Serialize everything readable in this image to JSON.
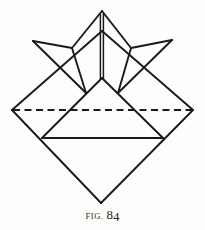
{
  "figure": {
    "caption_prefix": "FIG.",
    "caption_number_major": "8",
    "caption_number_minor": "4",
    "caption_full": "FIG. 84"
  },
  "style": {
    "background_color": "#fdfdfb",
    "ink_color": "#1a1a1a",
    "caption_color": "#2b2b2b",
    "solid_stroke_width": "1.9",
    "dashed_stroke_width": "2.0",
    "dash_pattern": "7,4.5"
  },
  "chart_data": {
    "type": "diagram",
    "units": "pixels",
    "canvas": {
      "width": 205,
      "height": 230
    },
    "points": {
      "star_apex": [
        102,
        11
      ],
      "star_left_tip": [
        33,
        41
      ],
      "star_right_tip": [
        172,
        40
      ],
      "star_left_notch": [
        72,
        48
      ],
      "star_right_notch": [
        131,
        48
      ],
      "diamond_top": [
        102,
        31
      ],
      "diamond_right": [
        193,
        110
      ],
      "diamond_bottom": [
        101,
        203
      ],
      "diamond_left": [
        12,
        110
      ],
      "inner_apex": [
        102,
        78
      ],
      "crease_left": [
        12,
        110
      ],
      "crease_right": [
        193,
        110
      ],
      "base_left": [
        42,
        138
      ],
      "base_right": [
        163,
        138
      ],
      "left_wing_elbow": [
        55,
        58
      ],
      "right_wing_elbow": [
        149,
        58
      ],
      "left_flap_foot": [
        86,
        93
      ],
      "right_flap_foot": [
        118,
        93
      ]
    },
    "segments": [
      {
        "name": "diamond-edge-top-left",
        "style": "solid",
        "from": "diamond_top",
        "to": "diamond_left"
      },
      {
        "name": "diamond-edge-top-right",
        "style": "solid",
        "from": "diamond_top",
        "to": "diamond_right"
      },
      {
        "name": "diamond-edge-bottom-left",
        "style": "solid",
        "from": "diamond_left",
        "to": "diamond_bottom"
      },
      {
        "name": "diamond-edge-bottom-right",
        "style": "solid",
        "from": "diamond_right",
        "to": "diamond_bottom"
      },
      {
        "name": "horizontal-crease",
        "style": "dashed",
        "from": "crease_left",
        "to": "crease_right"
      },
      {
        "name": "base-fold-line",
        "style": "solid",
        "from": "base_left",
        "to": "base_right"
      },
      {
        "name": "center-triangle-left",
        "style": "solid",
        "from": "inner_apex",
        "to": "base_left"
      },
      {
        "name": "center-triangle-right",
        "style": "solid",
        "from": "inner_apex",
        "to": "base_right"
      },
      {
        "name": "center-crease-vertical",
        "style": "double",
        "from": "star_apex",
        "to": "inner_apex"
      },
      {
        "name": "star-left-upper",
        "style": "solid",
        "from": "star_apex",
        "to": "star_left_notch"
      },
      {
        "name": "star-right-upper",
        "style": "solid",
        "from": "star_apex",
        "to": "star_right_notch"
      },
      {
        "name": "star-left-arm-top",
        "style": "solid",
        "from": "star_left_notch",
        "to": "star_left_tip"
      },
      {
        "name": "star-right-arm-top",
        "style": "solid",
        "from": "star_right_notch",
        "to": "star_right_tip"
      },
      {
        "name": "star-left-arm-lower",
        "style": "solid",
        "from": "star_left_tip",
        "to": "left_flap_foot"
      },
      {
        "name": "star-right-arm-lower",
        "style": "solid",
        "from": "star_right_tip",
        "to": "right_flap_foot"
      },
      {
        "name": "left-flap-inner-edge",
        "style": "solid",
        "from": "star_left_notch",
        "to": "left_flap_foot"
      },
      {
        "name": "right-flap-inner-edge",
        "style": "solid",
        "from": "star_right_notch",
        "to": "right_flap_foot"
      }
    ],
    "legend": [
      {
        "symbol": "solid line",
        "meaning": "visible paper edge or mountain fold"
      },
      {
        "symbol": "dashed line",
        "meaning": "hidden edge or valley crease"
      }
    ]
  }
}
